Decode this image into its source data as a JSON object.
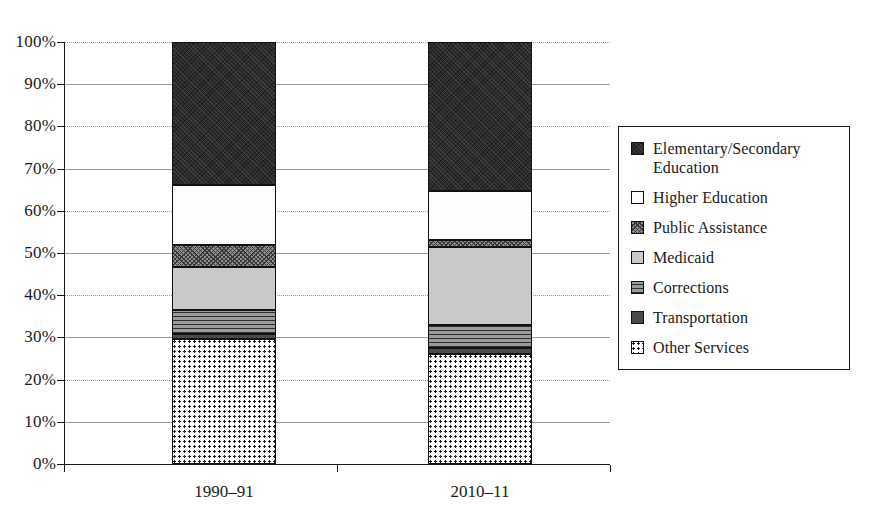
{
  "chart_data": {
    "type": "bar",
    "subtype": "stacked-100-percent",
    "title": "",
    "xlabel": "",
    "ylabel": "",
    "ylim": [
      0,
      100
    ],
    "ytick_labels": [
      "0%",
      "10%",
      "20%",
      "30%",
      "40%",
      "50%",
      "60%",
      "70%",
      "80%",
      "90%",
      "100%"
    ],
    "ytick_values": [
      0,
      10,
      20,
      30,
      40,
      50,
      60,
      70,
      80,
      90,
      100
    ],
    "grid": "horizontal",
    "legend_position": "right",
    "categories": [
      "1990–91",
      "2010–11"
    ],
    "series": [
      {
        "name": "Elementary/Secondary Education",
        "values": [
          34.0,
          35.2
        ],
        "pattern": "dark-crosshatch",
        "color": "#2b2b2b"
      },
      {
        "name": "Higher Education",
        "values": [
          14.2,
          11.8
        ],
        "pattern": "solid-white",
        "color": "#fdfdfb"
      },
      {
        "name": "Public Assistance",
        "values": [
          5.0,
          1.5
        ],
        "pattern": "diagonal-crosshatch",
        "color": "#8f8f8f"
      },
      {
        "name": "Medicaid",
        "values": [
          10.3,
          18.5
        ],
        "pattern": "light-gray",
        "color": "#c9c9c9"
      },
      {
        "name": "Corrections",
        "values": [
          5.8,
          5.5
        ],
        "pattern": "horizontal-lines",
        "color": "#9b9b9b"
      },
      {
        "name": "Transportation",
        "values": [
          1.1,
          1.5
        ],
        "pattern": "dark-gray",
        "color": "#4a4a4a"
      },
      {
        "name": "Other Services",
        "values": [
          29.6,
          26.0
        ],
        "pattern": "dotted",
        "color": "#ffffff"
      }
    ],
    "stack_order_bottom_to_top": [
      "Other Services",
      "Transportation",
      "Corrections",
      "Medicaid",
      "Public Assistance",
      "Higher Education",
      "Elementary/Secondary Education"
    ],
    "segment_boundaries": {
      "1990–91": {
        "Other Services": [
          0,
          29.6
        ],
        "Transportation": [
          29.6,
          30.7
        ],
        "Corrections": [
          30.7,
          36.5
        ],
        "Medicaid": [
          36.5,
          46.8
        ],
        "Public Assistance": [
          46.8,
          51.8
        ],
        "Higher Education": [
          51.8,
          66.0
        ],
        "Elementary/Secondary Education": [
          66.0,
          100
        ]
      },
      "2010–11": {
        "Other Services": [
          0,
          26.0
        ],
        "Transportation": [
          26.0,
          27.5
        ],
        "Corrections": [
          27.5,
          33.0
        ],
        "Medicaid": [
          33.0,
          51.5
        ],
        "Public Assistance": [
          51.5,
          53.0
        ],
        "Higher Education": [
          53.0,
          64.8
        ],
        "Elementary/Secondary Education": [
          64.8,
          100
        ]
      }
    }
  },
  "legend": {
    "entries": [
      {
        "label": "Elementary/Secondary Education",
        "swatch": "dark-crosshatch-swatch"
      },
      {
        "label": "Higher Education",
        "swatch": "white-swatch"
      },
      {
        "label": "Public Assistance",
        "swatch": "diagonal-crosshatch-swatch"
      },
      {
        "label": "Medicaid",
        "swatch": "light-gray-swatch"
      },
      {
        "label": "Corrections",
        "swatch": "horizontal-lines-swatch"
      },
      {
        "label": "Transportation",
        "swatch": "dark-gray-swatch"
      },
      {
        "label": "Other Services",
        "swatch": "dotted-swatch"
      }
    ]
  },
  "axes": {
    "y_ticks": [
      "100%",
      "90%",
      "80%",
      "70%",
      "60%",
      "50%",
      "40%",
      "30%",
      "20%",
      "10%",
      "0%"
    ],
    "x_ticks": [
      "1990–91",
      "2010–11"
    ]
  }
}
